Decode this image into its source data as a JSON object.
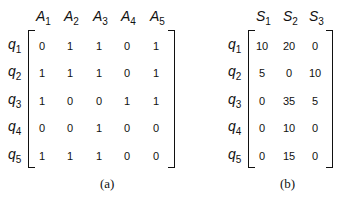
{
  "matrix_a": {
    "caption": "(a)",
    "columns": [
      "A",
      "A",
      "A",
      "A",
      "A"
    ],
    "column_subs": [
      "1",
      "2",
      "3",
      "4",
      "5"
    ],
    "rows": [
      "q",
      "q",
      "q",
      "q",
      "q"
    ],
    "row_subs": [
      "1",
      "2",
      "3",
      "4",
      "5"
    ],
    "values": [
      [
        "0",
        "1",
        "1",
        "0",
        "1"
      ],
      [
        "1",
        "1",
        "1",
        "0",
        "1"
      ],
      [
        "1",
        "0",
        "0",
        "1",
        "1"
      ],
      [
        "0",
        "0",
        "1",
        "0",
        "0"
      ],
      [
        "1",
        "1",
        "1",
        "0",
        "0"
      ]
    ]
  },
  "matrix_b": {
    "caption": "(b)",
    "columns": [
      "S",
      "S",
      "S"
    ],
    "column_subs": [
      "1",
      "2",
      "3"
    ],
    "rows": [
      "q",
      "q",
      "q",
      "q",
      "q"
    ],
    "row_subs": [
      "1",
      "2",
      "3",
      "4",
      "5"
    ],
    "values": [
      [
        "10",
        "20",
        "0"
      ],
      [
        "5",
        "0",
        "10"
      ],
      [
        "0",
        "35",
        "5"
      ],
      [
        "0",
        "10",
        "0"
      ],
      [
        "0",
        "15",
        "0"
      ]
    ]
  }
}
